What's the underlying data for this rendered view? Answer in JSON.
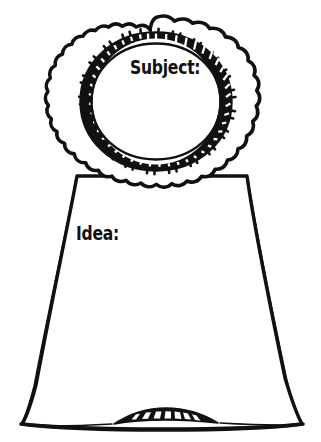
{
  "page": {
    "width": 321,
    "height": 442,
    "background_color": "#ffffff",
    "ink_color": "#111111"
  },
  "artwork": {
    "name": "award-ribbon-rosette",
    "style": "hand-drawn black ink line art, coloring-page template",
    "parts": [
      {
        "name": "outer-scalloped-ruffle-ring",
        "lobes": 18,
        "filled": false
      },
      {
        "name": "ruffle-tick-marks",
        "description": "short paired radial dashes on ruffle"
      },
      {
        "name": "inner-banded-ring",
        "description": "thick dark band with white ladder-rung dashes"
      },
      {
        "name": "inner-blank-circle",
        "description": "empty white writing area"
      },
      {
        "name": "ribbon-tail",
        "description": "trapezoid widening toward the bottom"
      },
      {
        "name": "ribbon-bottom-fold",
        "description": "lens shaped band with white segment rectangles"
      }
    ]
  },
  "labels": {
    "subject": "Subject:",
    "idea": "Idea:"
  },
  "fields": [
    {
      "name": "subject-field",
      "label": "Subject:",
      "value": "",
      "area": "rosette-center"
    },
    {
      "name": "idea-field",
      "label": "Idea:",
      "value": "",
      "area": "ribbon-tail"
    }
  ]
}
